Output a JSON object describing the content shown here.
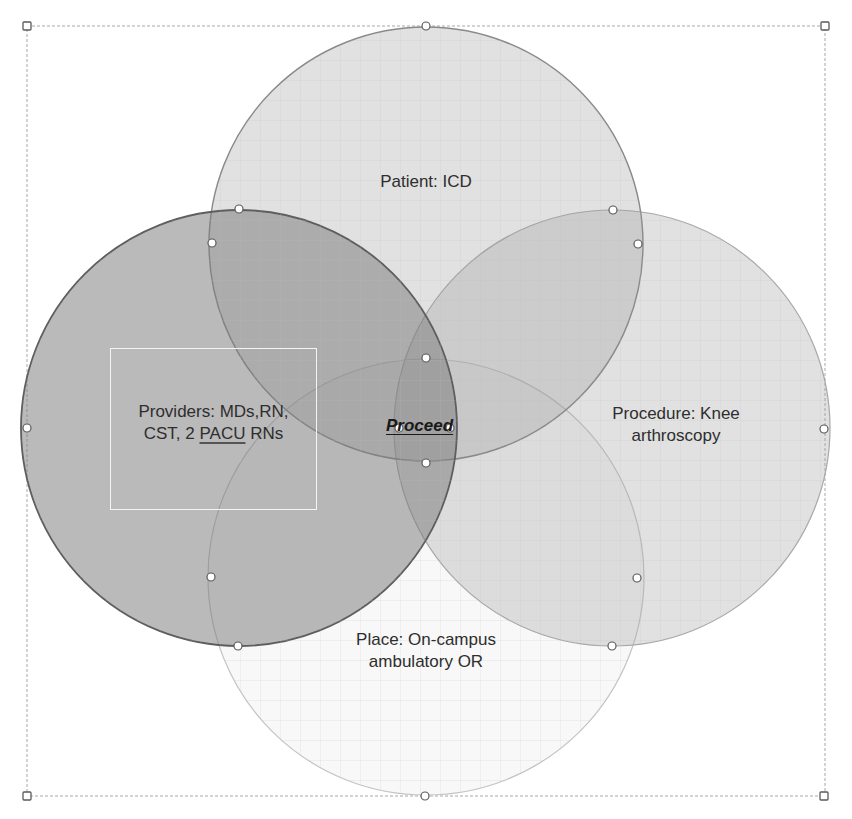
{
  "diagram": {
    "type": "venn",
    "circles": [
      {
        "id": "patient",
        "label": "Patient: ICD",
        "cx": 426,
        "cy": 244,
        "r": 217,
        "fill": "#9a9a9a",
        "opacity": 0.32
      },
      {
        "id": "providers",
        "label_lines": [
          "Providers: MDs,RN,",
          "CST, 2 ",
          "PACU",
          " RNs"
        ],
        "cx": 239,
        "cy": 428,
        "r": 218,
        "fill": "#7f7f7f",
        "opacity": 0.55
      },
      {
        "id": "procedure",
        "label_lines": [
          "Procedure: Knee",
          "arthroscopy"
        ],
        "cx": 612,
        "cy": 428,
        "r": 218,
        "fill": "#a0a0a0",
        "opacity": 0.32
      },
      {
        "id": "place",
        "label_lines": [
          "Place: On-campus",
          "ambulatory OR"
        ],
        "cx": 426,
        "cy": 577,
        "r": 218,
        "fill": "#d8d8d8",
        "opacity": 0.18
      }
    ],
    "center_label": "Proceed",
    "labels": {
      "patient": "Patient: ICD",
      "providers_line1": "Providers: MDs,RN,",
      "providers_line2_pre": "CST, 2 ",
      "providers_line2_flag": "PACU",
      "providers_line2_post": " RNs",
      "procedure_line1": "Procedure: Knee",
      "procedure_line2": "arthroscopy",
      "place_line1": "Place: On-campus",
      "place_line2": "ambulatory OR"
    },
    "selection_frame": {
      "x1": 27,
      "y1": 26,
      "x2": 825,
      "y2": 796
    },
    "colors": {
      "stroke": "#6e6e6e",
      "grid": "#c8c8c8",
      "frame": "#9a9a9a",
      "handle_fill": "#ffffff",
      "handle_stroke": "#555555"
    }
  }
}
